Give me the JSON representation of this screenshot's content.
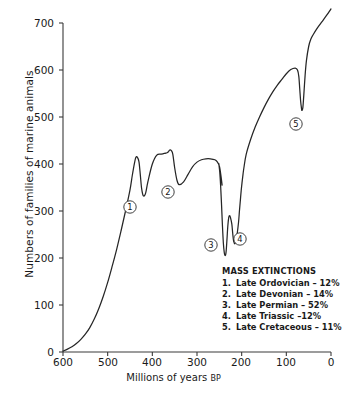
{
  "chart_data": {
    "type": "line",
    "title": "",
    "xlabel": "Millions of years BP",
    "ylabel": "Numbers of families of marine animals",
    "xlabel_main": "Millions of years",
    "xlabel_suffix": "BP",
    "xlim": [
      600,
      0
    ],
    "ylim": [
      0,
      730
    ],
    "x_ticks": [
      600,
      500,
      400,
      300,
      200,
      100,
      0
    ],
    "y_ticks": [
      0,
      100,
      200,
      300,
      400,
      500,
      600,
      700
    ],
    "x_tick_labels": [
      "600",
      "500",
      "400",
      "300",
      "200",
      "100",
      "0"
    ],
    "y_tick_labels": [
      "0",
      "100",
      "200",
      "300",
      "400",
      "500",
      "600",
      "700"
    ],
    "grid": false,
    "legend_position": "inside-lower-right",
    "line_color": "#262626",
    "series": [
      {
        "name": "Families of marine animals",
        "x": [
          600,
          590,
          580,
          570,
          560,
          550,
          540,
          530,
          520,
          510,
          500,
          490,
          480,
          470,
          460,
          450,
          445,
          440,
          437,
          434,
          430,
          427,
          424,
          420,
          415,
          410,
          400,
          390,
          380,
          375,
          370,
          367,
          364,
          362,
          360,
          357,
          354,
          350,
          345,
          340,
          330,
          320,
          310,
          300,
          290,
          280,
          270,
          260,
          255,
          250,
          248,
          246,
          244,
          251,
          249,
          247,
          245,
          243,
          241,
          239,
          237,
          235,
          233,
          231,
          229,
          227,
          225,
          222,
          220,
          218,
          215,
          213,
          210,
          207,
          205,
          203,
          201,
          199,
          197,
          195,
          190,
          180,
          170,
          160,
          150,
          140,
          130,
          120,
          110,
          100,
          90,
          80,
          75,
          72,
          70,
          68,
          66,
          65,
          63,
          61,
          58,
          55,
          50,
          45,
          40,
          30,
          20,
          10,
          0
        ],
        "y": [
          2,
          6,
          11,
          18,
          27,
          38,
          52,
          70,
          92,
          118,
          148,
          182,
          218,
          258,
          300,
          345,
          375,
          402,
          414,
          415,
          405,
          378,
          348,
          332,
          338,
          362,
          400,
          419,
          421,
          422,
          423,
          424,
          426,
          429,
          430,
          428,
          420,
          392,
          366,
          356,
          362,
          378,
          394,
          404,
          409,
          411,
          411,
          409,
          405,
          396,
          386,
          372,
          356,
          400,
          382,
          352,
          312,
          268,
          232,
          212,
          205,
          212,
          238,
          268,
          286,
          290,
          286,
          272,
          252,
          236,
          230,
          236,
          252,
          276,
          300,
          322,
          344,
          362,
          378,
          392,
          420,
          452,
          478,
          500,
          520,
          538,
          554,
          568,
          580,
          592,
          601,
          604,
          600,
          586,
          560,
          534,
          518,
          514,
          520,
          545,
          588,
          620,
          650,
          666,
          675,
          690,
          703,
          716,
          730
        ]
      }
    ],
    "annotations": [
      {
        "id": "1",
        "label": "1",
        "x_px": 130,
        "y_px": 207
      },
      {
        "id": "2",
        "label": "2",
        "x_px": 168,
        "y_px": 192
      },
      {
        "id": "3",
        "label": "3",
        "x_px": 211,
        "y_px": 245
      },
      {
        "id": "4",
        "label": "4",
        "x_px": 240,
        "y_px": 239
      },
      {
        "id": "5",
        "label": "5",
        "x_px": 296,
        "y_px": 124
      }
    ]
  },
  "legend": {
    "title": "MASS EXTINCTIONS",
    "items": [
      {
        "num": "1.",
        "text": "Late Ordovician – 12%"
      },
      {
        "num": "2.",
        "text": "Late Devonian – 14%"
      },
      {
        "num": "3.",
        "text": "Late Permian – 52%"
      },
      {
        "num": "4.",
        "text": "Late Triassic –12%"
      },
      {
        "num": "5.",
        "text": "Late Cretaceous – 11%"
      }
    ]
  },
  "caption": {
    "text": ""
  }
}
